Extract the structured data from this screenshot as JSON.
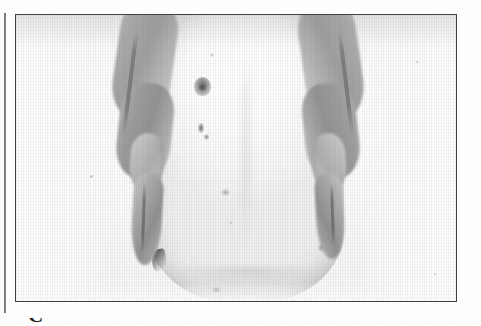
{
  "page": {
    "kind": "scanned-book-page",
    "background_color": "#fefefe",
    "width": 481,
    "height": 326
  },
  "margin_rule": {
    "name": "left-margin-rule",
    "color": "#4c4c4c"
  },
  "figure": {
    "frame_color": "#43423f",
    "photo": {
      "medium": "black-and-white photograph",
      "subject": "clinician's two hands palpating a distended pregnant abdomen",
      "orientation": "frontal view, patient supine, photographed from the feet",
      "background_color": "#fcfcfc",
      "skin_tone_color": "#f7f7f7",
      "hand_tone_color": "#a9a9a9",
      "shadow_color": "#6a6a6a"
    },
    "anatomy": [
      {
        "id": "abdomen",
        "label": "distended abdomen"
      },
      {
        "id": "umbilicus",
        "label": "umbilicus"
      },
      {
        "id": "hand-left",
        "label": "examiner's left hand"
      },
      {
        "id": "hand-right",
        "label": "examiner's right hand"
      },
      {
        "id": "thumb-left",
        "label": "left thumb"
      },
      {
        "id": "thumb-right",
        "label": "right thumb"
      },
      {
        "id": "flank-shadow",
        "label": "left flank shadow"
      },
      {
        "id": "lower-fold",
        "label": "lower abdominal fold"
      }
    ],
    "skin_marks": [
      {
        "id": "mark-a",
        "label": "skin mark"
      },
      {
        "id": "mark-b",
        "label": "skin mark"
      },
      {
        "id": "mark-c",
        "label": "skin mark"
      },
      {
        "id": "mark-d",
        "label": "skin mark"
      },
      {
        "id": "mark-e",
        "label": "skin mark"
      },
      {
        "id": "mark-f",
        "label": "skin mark"
      },
      {
        "id": "mark-g",
        "label": "skin mark"
      },
      {
        "id": "mark-h",
        "label": "skin mark"
      }
    ]
  },
  "caption": {
    "visible_fragment": "C",
    "note": "top edge of a caption character, clipped by the bottom of the page"
  }
}
